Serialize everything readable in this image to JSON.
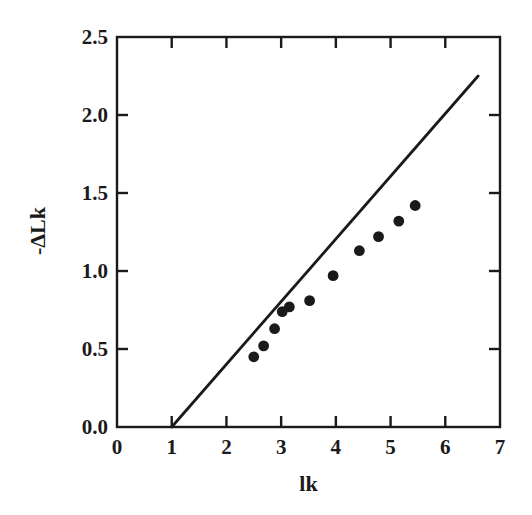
{
  "chart_data": {
    "type": "scatter",
    "title": "",
    "xlabel": "lk",
    "ylabel": "-ΔLk",
    "xlim": [
      0,
      7
    ],
    "ylim": [
      0.0,
      2.5
    ],
    "xticks": [
      0,
      1,
      2,
      3,
      4,
      5,
      6,
      7
    ],
    "xtick_labels": [
      "0",
      "1",
      "2",
      "3",
      "4",
      "5",
      "6",
      "7"
    ],
    "yticks": [
      0.0,
      0.5,
      1.0,
      1.5,
      2.0,
      2.5
    ],
    "ytick_labels": [
      "0.0",
      "0.5",
      "1.0",
      "1.5",
      "2.0",
      "2.5"
    ],
    "grid": false,
    "legend": null,
    "marker_color": "#1a1a1a",
    "line_color": "#1a1a1a",
    "axis_color": "#1a1a1a",
    "series": [
      {
        "name": "data points",
        "type": "scatter",
        "marker": "filled-circle",
        "points": [
          {
            "x": 2.5,
            "y": 0.45
          },
          {
            "x": 2.68,
            "y": 0.52
          },
          {
            "x": 2.88,
            "y": 0.63
          },
          {
            "x": 3.02,
            "y": 0.74
          },
          {
            "x": 3.15,
            "y": 0.77
          },
          {
            "x": 3.52,
            "y": 0.81
          },
          {
            "x": 3.95,
            "y": 0.97
          },
          {
            "x": 4.43,
            "y": 1.13
          },
          {
            "x": 4.78,
            "y": 1.22
          },
          {
            "x": 5.15,
            "y": 1.32
          },
          {
            "x": 5.45,
            "y": 1.42
          }
        ]
      },
      {
        "name": "reference line",
        "type": "line",
        "points": [
          {
            "x": 1.0,
            "y": 0.0
          },
          {
            "x": 6.6,
            "y": 2.25
          }
        ]
      }
    ]
  },
  "figure": {
    "background": "#ffffff"
  }
}
